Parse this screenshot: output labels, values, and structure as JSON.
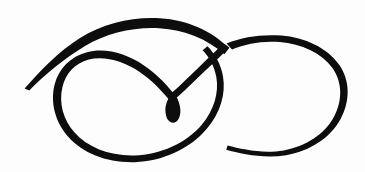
{
  "artwork": {
    "title": "Calligraphic Flourish",
    "subject": "ornamental double-loop pen flourish",
    "medium": "black ink on white paper",
    "canvas": {
      "width": 365,
      "height": 172,
      "background_color": "#fdfdfd"
    },
    "ink_color": "#0d0d0d",
    "strokes": [
      {
        "name": "upper-sweep-stroke",
        "description": "long tapering sweep rising from a hairline point at lower left, swelling thick across the top, then descending to the right through the crossing point",
        "start_point": [
          25,
          88
        ],
        "end_point": [
          228,
          52
        ],
        "min_width": 1,
        "max_width": 9
      },
      {
        "name": "descending-stroke",
        "description": "thick stroke continuing down-left from the crossing to the central teardrop bulb",
        "start_point": [
          228,
          52
        ],
        "end_point": [
          173,
          100
        ],
        "min_width": 3,
        "max_width": 7
      },
      {
        "name": "left-loop-stroke",
        "description": "large oval loop opening from the central bulb, arcing up and left, around the bottom and back up the right side to the crossing region",
        "start_point": [
          173,
          100
        ],
        "end_point": [
          228,
          52
        ],
        "min_width": 2,
        "max_width": 5
      },
      {
        "name": "right-loop-stroke",
        "description": "second loop leaving the crossing, thick along the top, thinning down the right side and tapering to a hairline at the lower left of the loop",
        "start_point": [
          228,
          52
        ],
        "end_point": [
          226,
          149
        ],
        "min_width": 1,
        "max_width": 9
      },
      {
        "name": "center-teardrop-bulb",
        "description": "solid teardrop-shaped ink blob where the strokes converge",
        "center": [
          173,
          105
        ],
        "width": 13,
        "height": 20
      }
    ],
    "ink_bounds": {
      "left": 24,
      "top": 17,
      "right": 346,
      "bottom": 151
    }
  }
}
